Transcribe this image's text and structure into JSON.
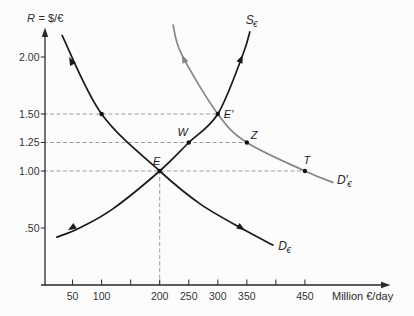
{
  "chart_data": {
    "type": "line",
    "title": "",
    "xlabel": "Million €/day",
    "ylabel": "R = $/€",
    "ylabel_var": "R",
    "ylabel_rest": "= $/€",
    "xlim": [
      0,
      540
    ],
    "ylim": [
      0,
      2.35
    ],
    "grid": false,
    "x_ticks": [
      {
        "v": 50,
        "label": "50"
      },
      {
        "v": 100,
        "label": "100"
      },
      {
        "v": 150,
        "label": ""
      },
      {
        "v": 200,
        "label": "200"
      },
      {
        "v": 250,
        "label": "250"
      },
      {
        "v": 300,
        "label": "300"
      },
      {
        "v": 350,
        "label": "350"
      },
      {
        "v": 400,
        "label": ""
      },
      {
        "v": 450,
        "label": "450"
      }
    ],
    "y_ticks": [
      {
        "v": 0.5,
        "label": ".50"
      },
      {
        "v": 1.0,
        "label": "1.00"
      },
      {
        "v": 1.25,
        "label": "1.25"
      },
      {
        "v": 1.5,
        "label": "1.50"
      },
      {
        "v": 2.0,
        "label": "2.00"
      }
    ],
    "series": [
      {
        "id": "demand",
        "name": "Demand for euros",
        "label_main": "D",
        "label_sub": "€",
        "color": "#1a1a1a",
        "label_pos": [
          404,
          0.31
        ],
        "sub_dx": 8,
        "points": [
          [
            32,
            2.19
          ],
          [
            100,
            1.5
          ],
          [
            200,
            1.0
          ],
          [
            270,
            0.71
          ],
          [
            347,
            0.48
          ],
          [
            395,
            0.35
          ]
        ]
      },
      {
        "id": "supply",
        "name": "Supply of euros",
        "label_main": "S",
        "label_sub": "€",
        "color": "#1a1a1a",
        "label_pos": [
          348,
          2.29
        ],
        "sub_dx": 7,
        "points": [
          [
            23,
            0.42
          ],
          [
            62,
            0.5
          ],
          [
            120,
            0.67
          ],
          [
            200,
            1.0
          ],
          [
            250,
            1.25
          ],
          [
            300,
            1.5
          ],
          [
            343,
            2.02
          ],
          [
            355,
            2.22
          ]
        ]
      },
      {
        "id": "demand_shifted",
        "name": "Shifted demand for euros",
        "label_main": "D′",
        "label_sub": "€",
        "color": "#868686",
        "label_pos": [
          505,
          0.89
        ],
        "sub_dx": 10,
        "points": [
          [
            223,
            2.28
          ],
          [
            238,
            2.02
          ],
          [
            300,
            1.5
          ],
          [
            350,
            1.25
          ],
          [
            450,
            1.0
          ],
          [
            498,
            0.9
          ]
        ]
      }
    ],
    "points": [
      {
        "label": "E",
        "q": 200,
        "R": 1.0,
        "dx": -3,
        "dy": -6,
        "anchor": "middle"
      },
      {
        "label": "E′",
        "q": 300,
        "R": 1.5,
        "dx": 6,
        "dy": 4,
        "anchor": "start"
      },
      {
        "label": "W",
        "q": 250,
        "R": 1.25,
        "dx": -6,
        "dy": -7,
        "anchor": "middle"
      },
      {
        "label": "Z",
        "q": 350,
        "R": 1.25,
        "dx": 4,
        "dy": -4,
        "anchor": "start"
      },
      {
        "label": "T",
        "q": 450,
        "R": 1.0,
        "dx": 2,
        "dy": -7,
        "anchor": "middle"
      },
      {
        "label": "",
        "q": 100,
        "R": 1.5,
        "dx": 0,
        "dy": 0,
        "anchor": "middle"
      }
    ],
    "guides": [
      {
        "x1": 0,
        "y1": 1.5,
        "x2": 300,
        "y2": 1.5
      },
      {
        "x1": 0,
        "y1": 1.25,
        "x2": 350,
        "y2": 1.25
      },
      {
        "x1": 0,
        "y1": 1.0,
        "x2": 450,
        "y2": 1.0
      },
      {
        "x1": 200,
        "y1": 0,
        "x2": 200,
        "y2": 1.0
      }
    ],
    "arrows": [
      {
        "series": "demand",
        "q": 44,
        "R": 2.0,
        "angle": 243
      },
      {
        "series": "demand",
        "q": 347,
        "R": 0.48,
        "angle": 32
      },
      {
        "series": "supply",
        "q": 42,
        "R": 0.48,
        "angle": 148
      },
      {
        "series": "supply",
        "q": 343,
        "R": 2.02,
        "angle": -67
      },
      {
        "series": "demand_shifted",
        "q": 238,
        "R": 2.02,
        "angle": 245
      }
    ],
    "colors": {
      "curve_black": "#1a1a1a",
      "curve_gray": "#868686",
      "guide_gray": "#9e9e9e",
      "axis": "#2a2a2a",
      "text": "#2b2b2b"
    }
  }
}
